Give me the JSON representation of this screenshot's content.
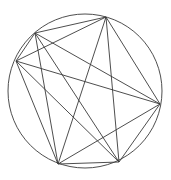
{
  "diagram": {
    "type": "complete-graph-inscribed-in-circle",
    "circle": {
      "cx": 85,
      "cy": 91,
      "r": 77
    },
    "vertices": [
      {
        "id": "A",
        "x": 35,
        "y": 33
      },
      {
        "id": "B",
        "x": 106,
        "y": 17
      },
      {
        "id": "C",
        "x": 16,
        "y": 61
      },
      {
        "id": "D",
        "x": 160,
        "y": 104
      },
      {
        "id": "E",
        "x": 58,
        "y": 164
      },
      {
        "id": "F",
        "x": 119,
        "y": 162
      }
    ],
    "edges": [
      [
        "A",
        "B"
      ],
      [
        "A",
        "C"
      ],
      [
        "A",
        "D"
      ],
      [
        "A",
        "E"
      ],
      [
        "A",
        "F"
      ],
      [
        "B",
        "C"
      ],
      [
        "B",
        "D"
      ],
      [
        "B",
        "E"
      ],
      [
        "B",
        "F"
      ],
      [
        "C",
        "D"
      ],
      [
        "C",
        "E"
      ],
      [
        "C",
        "F"
      ],
      [
        "D",
        "E"
      ],
      [
        "D",
        "F"
      ],
      [
        "E",
        "F"
      ]
    ],
    "stroke_color": "#3a3a3a"
  }
}
